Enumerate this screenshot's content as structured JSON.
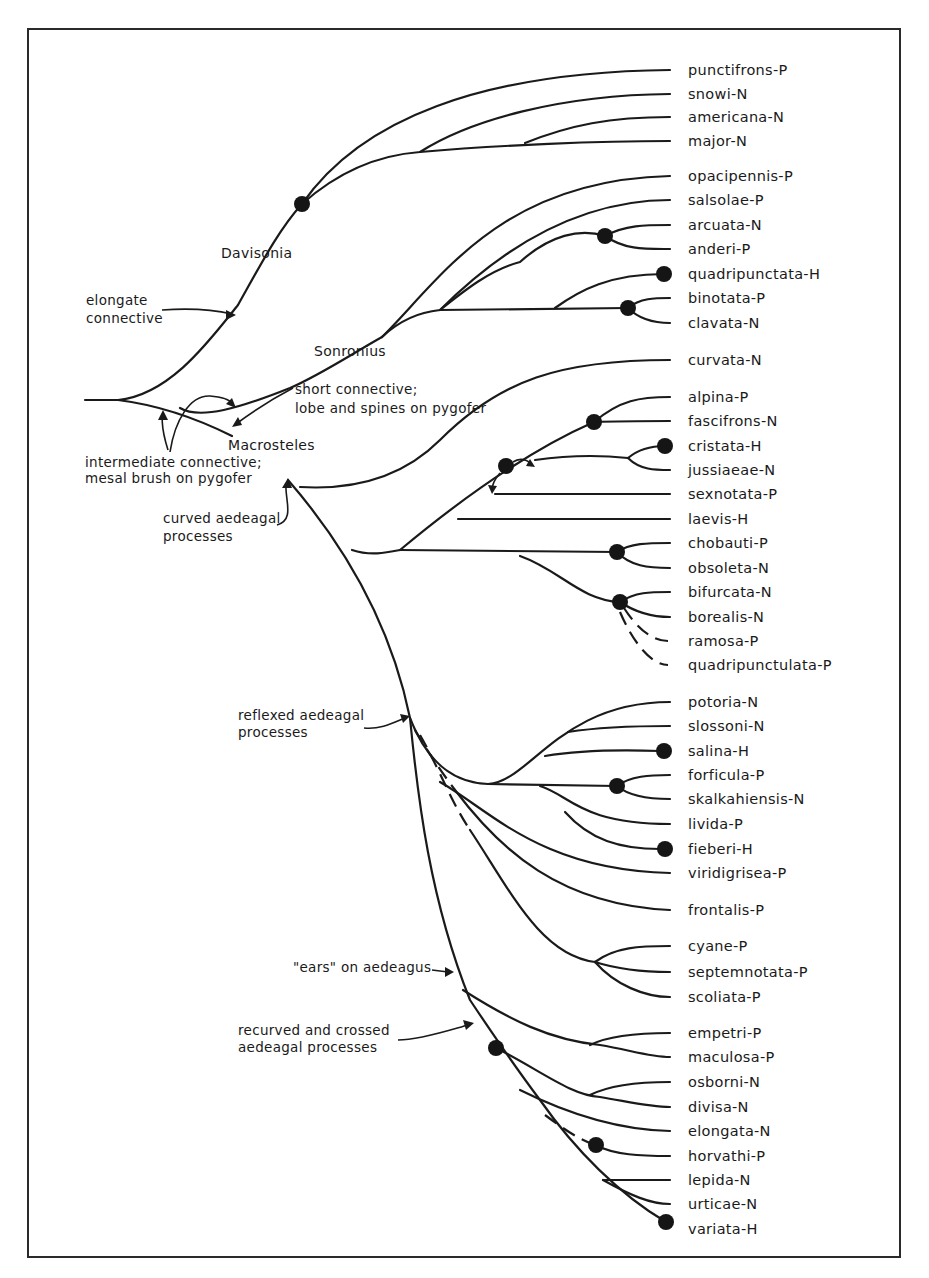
{
  "diagram": {
    "type": "phylogenetic-tree",
    "frame": {
      "x": 28,
      "y": 29,
      "width": 872,
      "height": 1228
    },
    "colors": {
      "ink": "#1a1a1a",
      "background": "#ffffff",
      "node": "#151515"
    },
    "genera": [
      {
        "id": "davisonia",
        "label": "Davisonia",
        "x": 221,
        "y": 258
      },
      {
        "id": "sonronius",
        "label": "Sonronius",
        "x": 314,
        "y": 356
      },
      {
        "id": "macrosteles",
        "label": "Macrosteles",
        "x": 228,
        "y": 450
      }
    ],
    "annotations": [
      {
        "id": "elongate-connective",
        "lines": [
          "elongate",
          "connective"
        ],
        "x": 86,
        "y": 305
      },
      {
        "id": "short-connective",
        "lines": [
          "short connective;",
          "lobe and spines on pygofer"
        ],
        "x": 295,
        "y": 394
      },
      {
        "id": "intermediate-connective",
        "lines": [
          "intermediate connective;",
          "mesal brush on pygofer"
        ],
        "x": 85,
        "y": 467
      },
      {
        "id": "curved-aedeagal",
        "lines": [
          "curved aedeagal",
          "processes"
        ],
        "x": 163,
        "y": 523
      },
      {
        "id": "reflexed-aedeagal",
        "lines": [
          "reflexed aedeagal",
          "processes"
        ],
        "x": 238,
        "y": 720
      },
      {
        "id": "ears-on-aedeagus",
        "lines": [
          "\"ears\" on aedeagus"
        ],
        "x": 293,
        "y": 972
      },
      {
        "id": "recurved-crossed",
        "lines": [
          "recurved and crossed",
          "aedeagal processes"
        ],
        "x": 238,
        "y": 1035
      }
    ],
    "taxa": [
      {
        "name": "punctifrons",
        "code": "P",
        "label": "punctifrons-P",
        "y": 70
      },
      {
        "name": "snowi",
        "code": "N",
        "label": "snowi-N",
        "y": 94
      },
      {
        "name": "americana",
        "code": "N",
        "label": "americana-N",
        "y": 117
      },
      {
        "name": "major",
        "code": "N",
        "label": "major-N",
        "y": 141
      },
      {
        "name": "opacipennis",
        "code": "P",
        "label": "opacipennis-P",
        "y": 176
      },
      {
        "name": "salsolae",
        "code": "P",
        "label": "salsolae-P",
        "y": 200
      },
      {
        "name": "arcuata",
        "code": "N",
        "label": "arcuata-N",
        "y": 225
      },
      {
        "name": "anderi",
        "code": "P",
        "label": "anderi-P",
        "y": 249
      },
      {
        "name": "quadripunctata",
        "code": "H",
        "label": "quadripunctata-H",
        "y": 274
      },
      {
        "name": "binotata",
        "code": "P",
        "label": "binotata-P",
        "y": 298
      },
      {
        "name": "clavata",
        "code": "N",
        "label": "clavata-N",
        "y": 323
      },
      {
        "name": "curvata",
        "code": "N",
        "label": "curvata-N",
        "y": 360
      },
      {
        "name": "alpina",
        "code": "P",
        "label": "alpina-P",
        "y": 397
      },
      {
        "name": "fascifrons",
        "code": "N",
        "label": "fascifrons-N",
        "y": 421
      },
      {
        "name": "cristata",
        "code": "H",
        "label": "cristata-H",
        "y": 446
      },
      {
        "name": "jussiaeae",
        "code": "N",
        "label": "jussiaeae-N",
        "y": 470
      },
      {
        "name": "sexnotata",
        "code": "P",
        "label": "sexnotata-P",
        "y": 494
      },
      {
        "name": "laevis",
        "code": "H",
        "label": "laevis-H",
        "y": 519
      },
      {
        "name": "chobauti",
        "code": "P",
        "label": "chobauti-P",
        "y": 543
      },
      {
        "name": "obsoleta",
        "code": "N",
        "label": "obsoleta-N",
        "y": 568
      },
      {
        "name": "bifurcata",
        "code": "N",
        "label": "bifurcata-N",
        "y": 592
      },
      {
        "name": "borealis",
        "code": "N",
        "label": "borealis-N",
        "y": 617
      },
      {
        "name": "ramosa",
        "code": "P",
        "label": "ramosa-P",
        "y": 641
      },
      {
        "name": "quadripunctulata",
        "code": "P",
        "label": "quadripunctulata-P",
        "y": 665
      },
      {
        "name": "potoria",
        "code": "N",
        "label": "potoria-N",
        "y": 702
      },
      {
        "name": "slossoni",
        "code": "N",
        "label": "slossoni-N",
        "y": 726
      },
      {
        "name": "salina",
        "code": "H",
        "label": "salina-H",
        "y": 751
      },
      {
        "name": "forficula",
        "code": "P",
        "label": "forficula-P",
        "y": 775
      },
      {
        "name": "skalkahiensis",
        "code": "N",
        "label": "skalkahiensis-N",
        "y": 799
      },
      {
        "name": "livida",
        "code": "P",
        "label": "livida-P",
        "y": 824
      },
      {
        "name": "fieberi",
        "code": "H",
        "label": "fieberi-H",
        "y": 849
      },
      {
        "name": "viridigrisea",
        "code": "P",
        "label": "viridigrisea-P",
        "y": 873
      },
      {
        "name": "frontalis",
        "code": "P",
        "label": "frontalis-P",
        "y": 910
      },
      {
        "name": "cyane",
        "code": "P",
        "label": "cyane-P",
        "y": 946
      },
      {
        "name": "septemnotata",
        "code": "P",
        "label": "septemnotata-P",
        "y": 972
      },
      {
        "name": "scoliata",
        "code": "P",
        "label": "scoliata-P",
        "y": 997
      },
      {
        "name": "empetri",
        "code": "P",
        "label": "empetri-P",
        "y": 1033
      },
      {
        "name": "maculosa",
        "code": "P",
        "label": "maculosa-P",
        "y": 1057
      },
      {
        "name": "osborni",
        "code": "N",
        "label": "osborni-N",
        "y": 1082
      },
      {
        "name": "divisa",
        "code": "N",
        "label": "divisa-N",
        "y": 1107
      },
      {
        "name": "elongata",
        "code": "N",
        "label": "elongata-N",
        "y": 1131
      },
      {
        "name": "horvathi",
        "code": "P",
        "label": "horvathi-P",
        "y": 1156
      },
      {
        "name": "lepida",
        "code": "N",
        "label": "lepida-N",
        "y": 1180
      },
      {
        "name": "urticae",
        "code": "N",
        "label": "urticae-N",
        "y": 1204
      },
      {
        "name": "variata",
        "code": "H",
        "label": "variata-H",
        "y": 1229
      }
    ],
    "legend_codes": {
      "P": "P",
      "N": "N",
      "H": "H"
    }
  }
}
